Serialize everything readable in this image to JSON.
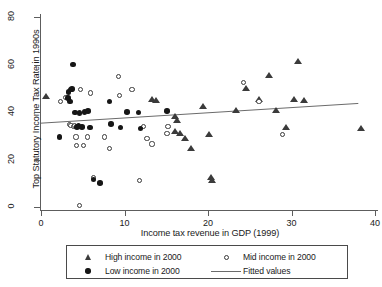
{
  "chart_data": {
    "type": "scatter",
    "title": "",
    "xlabel": "Income tax revenue in GDP (1999)",
    "ylabel": "Top Statutory Income Tax Rate in 1990s",
    "xlim": [
      0,
      40
    ],
    "ylim": [
      0,
      80
    ],
    "xticks": [
      0,
      10,
      20,
      30,
      40
    ],
    "yticks": [
      0,
      20,
      40,
      60,
      80
    ],
    "grid": false,
    "legend_position": "bottom-outside",
    "legend": [
      {
        "label": "High income in 2000",
        "marker": "filled-triangle"
      },
      {
        "label": "Mid income in 2000",
        "marker": "open-circle"
      },
      {
        "label": "Low income in 2000",
        "marker": "filled-circle"
      },
      {
        "label": "Fitted values",
        "marker": "line"
      }
    ],
    "series": [
      {
        "name": "High income in 2000",
        "marker": "filled-triangle",
        "color": "#3b3b3b",
        "points": [
          [
            0.6,
            46.5
          ],
          [
            13.3,
            45.5
          ],
          [
            13.8,
            44.8
          ],
          [
            16.1,
            38.0
          ],
          [
            16.3,
            36.3
          ],
          [
            16.1,
            31.8
          ],
          [
            16.6,
            31.2
          ],
          [
            17.3,
            28.8
          ],
          [
            18.0,
            24.6
          ],
          [
            19.4,
            42.5
          ],
          [
            20.1,
            30.5
          ],
          [
            20.3,
            12.3
          ],
          [
            20.5,
            11.0
          ],
          [
            23.4,
            40.5
          ],
          [
            24.6,
            50.0
          ],
          [
            26.1,
            45.5
          ],
          [
            27.3,
            55.5
          ],
          [
            28.1,
            40.5
          ],
          [
            29.4,
            33.5
          ],
          [
            30.3,
            45.5
          ],
          [
            30.8,
            61.5
          ],
          [
            31.5,
            45.0
          ],
          [
            38.3,
            33.0
          ]
        ]
      },
      {
        "name": "Mid income in 2000",
        "marker": "open-circle",
        "color": "#3a3a3a",
        "points": [
          [
            2.3,
            44.5
          ],
          [
            3.0,
            46.0
          ],
          [
            3.4,
            34.8
          ],
          [
            3.6,
            34.3
          ],
          [
            3.9,
            34.0
          ],
          [
            4.0,
            34.2
          ],
          [
            4.2,
            29.5
          ],
          [
            4.3,
            26.0
          ],
          [
            4.6,
            0.5
          ],
          [
            4.7,
            49.5
          ],
          [
            5.1,
            26.0
          ],
          [
            5.6,
            29.5
          ],
          [
            5.9,
            48.0
          ],
          [
            6.3,
            12.5
          ],
          [
            7.6,
            29.5
          ],
          [
            8.2,
            24.5
          ],
          [
            9.3,
            55.0
          ],
          [
            9.4,
            47.0
          ],
          [
            10.9,
            49.5
          ],
          [
            11.8,
            11.0
          ],
          [
            12.3,
            33.8
          ],
          [
            12.7,
            29.0
          ],
          [
            13.3,
            26.5
          ],
          [
            15.1,
            31.0
          ],
          [
            15.2,
            34.0
          ],
          [
            24.3,
            52.5
          ],
          [
            26.1,
            44.5
          ],
          [
            28.9,
            30.5
          ]
        ]
      },
      {
        "name": "Low income in 2000",
        "marker": "filled-circle",
        "color": "#161616",
        "points": [
          [
            2.2,
            29.5
          ],
          [
            3.2,
            46.0
          ],
          [
            3.3,
            48.5
          ],
          [
            3.5,
            44.5
          ],
          [
            3.6,
            49.5
          ],
          [
            3.7,
            49.8
          ],
          [
            3.8,
            60.0
          ],
          [
            4.1,
            39.8
          ],
          [
            4.3,
            33.8
          ],
          [
            4.5,
            34.0
          ],
          [
            4.6,
            39.5
          ],
          [
            4.9,
            33.8
          ],
          [
            5.2,
            40.0
          ],
          [
            5.6,
            40.3
          ],
          [
            5.9,
            33.5
          ],
          [
            6.3,
            11.5
          ],
          [
            7.1,
            10.0
          ],
          [
            8.2,
            44.5
          ],
          [
            8.4,
            35.0
          ],
          [
            9.5,
            33.5
          ],
          [
            10.3,
            40.0
          ],
          [
            11.7,
            39.8
          ],
          [
            11.9,
            33.0
          ],
          [
            15.1,
            40.3
          ]
        ]
      }
    ],
    "fitted_line": {
      "name": "Fitted values",
      "color": "#6b6b6b",
      "x": [
        0.0,
        38.0
      ],
      "y": [
        35.3,
        43.6
      ]
    }
  }
}
